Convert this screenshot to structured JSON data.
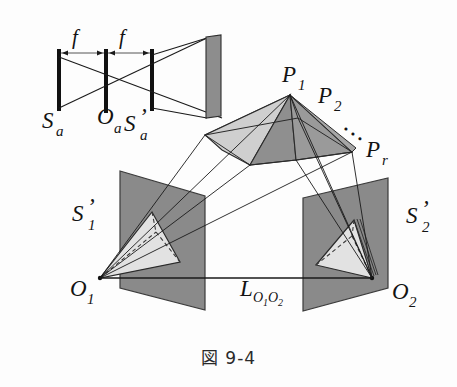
{
  "figure": {
    "caption": "図 9-4",
    "caption_label": "figure-9-4"
  },
  "colors": {
    "ink": "#131313",
    "line": "#1a1a1a",
    "plane_dark": "#8a8a8a",
    "plane_dark_edge": "#4a4a4a",
    "face_light": "#d6d6d6",
    "face_mid": "#b9b9b9",
    "face_dark": "#8f8f8f",
    "screen_gray": "#8d8d8d",
    "background": "#ffffff",
    "triangle_light": "#e0e0e0",
    "dashed": "#3a3a3a"
  },
  "optics": {
    "name": "thin-lens-schematic",
    "focal_labels": [
      {
        "text": "f",
        "x": 75,
        "y": 44
      },
      {
        "text": "f",
        "x": 122,
        "y": 44
      }
    ],
    "plane_labels": [
      {
        "base": "S",
        "sub": "a",
        "prime": false,
        "x": 48,
        "y": 128
      },
      {
        "base": "O",
        "sub": "a",
        "prime": false,
        "x": 105,
        "y": 122
      },
      {
        "base": "S",
        "sub": "a",
        "prime": true,
        "x": 136,
        "y": 130
      }
    ],
    "bars": [
      {
        "name": "object-plane-bar",
        "x": 59,
        "y1": 50,
        "y2": 110
      },
      {
        "name": "lens-plane-bar",
        "x": 106,
        "y1": 50,
        "y2": 112
      },
      {
        "name": "image-plane-bar",
        "x": 152,
        "y1": 50,
        "y2": 110
      }
    ],
    "screen": {
      "name": "screen-rectangle",
      "x": 205,
      "y": 36,
      "w": 16,
      "h": 82
    }
  },
  "scene": {
    "point_labels": [
      {
        "base": "P",
        "sub": "1",
        "prime": false,
        "x": 288,
        "y": 82
      },
      {
        "base": "P",
        "sub": "2",
        "prime": false,
        "x": 323,
        "y": 103
      },
      {
        "base": "P",
        "sub": "r",
        "prime": false,
        "x": 372,
        "y": 157
      }
    ],
    "ellipsis": {
      "text": "···",
      "x": 344,
      "y": 131
    },
    "plane_labels": [
      {
        "base": "S",
        "sub": "1",
        "prime": true,
        "x": 78,
        "y": 220
      },
      {
        "base": "S",
        "sub": "2",
        "prime": true,
        "x": 412,
        "y": 222
      }
    ],
    "center_labels": [
      {
        "base": "O",
        "sub": "1",
        "prime": false,
        "x": 76,
        "y": 295
      },
      {
        "base": "O",
        "sub": "2",
        "prime": false,
        "x": 398,
        "y": 298
      }
    ],
    "baseline_label": {
      "base": "L",
      "sub": "O₁O₂",
      "x": 243,
      "y": 295,
      "text": "L"
    },
    "baseline_sub_main": "O",
    "baseline_sub_1": "1",
    "baseline_sub_o2": "O",
    "baseline_sub_2": "2"
  }
}
